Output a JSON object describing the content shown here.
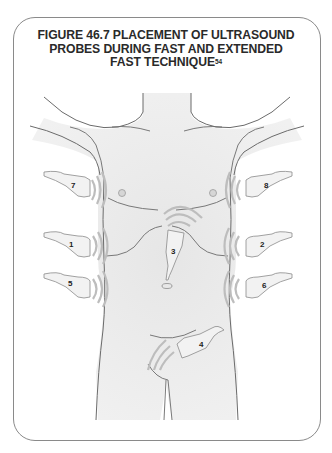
{
  "figure": {
    "title_line1": "FIGURE 46.7 PLACEMENT OF ULTRASOUND",
    "title_line2": "PROBES DURING FAST AND EXTENDED",
    "title_line3": "FAST  TECHNIQUE",
    "title_superscript": "54"
  },
  "probes": [
    {
      "label": "1",
      "position": "right flank (upper)"
    },
    {
      "label": "2",
      "position": "left flank (upper)"
    },
    {
      "label": "3",
      "position": "subxiphoid"
    },
    {
      "label": "4",
      "position": "suprapubic"
    },
    {
      "label": "5",
      "position": "right flank (lower)"
    },
    {
      "label": "6",
      "position": "left flank (lower)"
    },
    {
      "label": "7",
      "position": "right thorax"
    },
    {
      "label": "8",
      "position": "left thorax"
    }
  ],
  "colors": {
    "frame": "#8a8a8a",
    "body_fill": "#ececec",
    "outline": "#6b6b6b",
    "probe_fill": "#f2f2f2",
    "waves": "#bdbdbd",
    "title_text": "#2a2a2a"
  }
}
